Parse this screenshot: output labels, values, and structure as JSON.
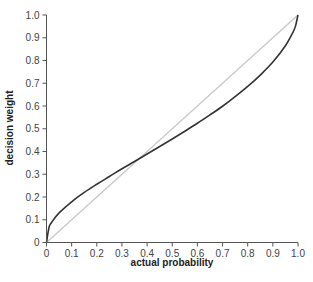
{
  "chart_data": {
    "type": "line",
    "title": "",
    "xlabel": "actual probability",
    "ylabel": "decision weight",
    "xlim": [
      0,
      1
    ],
    "ylim": [
      0,
      1
    ],
    "grid": false,
    "legend": null,
    "x_ticks": [
      "0",
      "0.1",
      "0.2",
      "0.3",
      "0.4",
      "0.5",
      "0.6",
      "0.7",
      "0.8",
      "0.9",
      "1.0"
    ],
    "y_ticks": [
      "0",
      "0.1",
      "0.2",
      "0.3",
      "0.4",
      "0.5",
      "0.6",
      "0.7",
      "0.8",
      "0.9",
      "1.0"
    ],
    "series": [
      {
        "name": "decision weight curve",
        "color": "#333333",
        "style": "solid",
        "x": [
          0,
          0.01,
          0.02,
          0.05,
          0.1,
          0.15,
          0.2,
          0.25,
          0.3,
          0.35,
          0.4,
          0.45,
          0.5,
          0.55,
          0.6,
          0.65,
          0.7,
          0.75,
          0.8,
          0.85,
          0.9,
          0.95,
          0.98,
          0.99,
          1.0
        ],
        "y": [
          0,
          0.067,
          0.088,
          0.13,
          0.179,
          0.22,
          0.256,
          0.29,
          0.324,
          0.356,
          0.389,
          0.422,
          0.455,
          0.489,
          0.524,
          0.561,
          0.599,
          0.641,
          0.686,
          0.736,
          0.793,
          0.865,
          0.924,
          0.951,
          1.0
        ]
      },
      {
        "name": "reference diagonal",
        "color": "#c8c8c8",
        "style": "solid",
        "x": [
          0,
          1
        ],
        "y": [
          0,
          1
        ]
      }
    ]
  },
  "colors": {
    "axis": "#555555",
    "curve": "#333333",
    "diagonal": "#c8c8c8",
    "text": "#444444"
  }
}
